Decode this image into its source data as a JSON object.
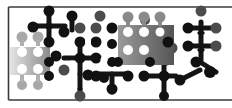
{
  "image": {
    "description": "Abstract molecular / metaball pattern in a framed rectangle",
    "colors": {
      "background": "#ffffff",
      "frame": "#3a3a3a",
      "black": "#111111",
      "dark_gray": "#4a4a4a",
      "mid_gray": "#7a7a7a",
      "light_gray": "#b5b5b5",
      "lightest": "#dcdcdc"
    },
    "frame": {
      "left": 8,
      "top": 7,
      "bottom": 100,
      "right_open": true
    },
    "grid": {
      "pitch": 16,
      "radius": 6
    }
  }
}
